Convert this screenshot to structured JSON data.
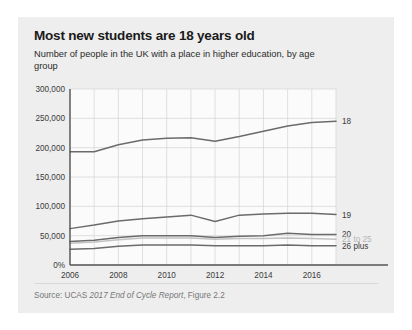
{
  "card": {
    "background": "#eeeeee"
  },
  "header": {
    "title": "Most new students are 18 years old",
    "subtitle": "Number of people in the UK with a place in higher education, by age group"
  },
  "footer": {
    "source_prefix": "Source: UCAS ",
    "source_italic": "2017 End of Cycle Report",
    "source_suffix": ", Figure 2.2"
  },
  "chart_data": {
    "type": "line",
    "title": "Most new students are 18 years old",
    "subtitle": "Number of people in the UK with a place in higher education, by age group",
    "xlabel": "",
    "ylabel": "",
    "x": [
      2006,
      2007,
      2008,
      2009,
      2010,
      2011,
      2012,
      2013,
      2014,
      2015,
      2016,
      2017
    ],
    "xlim": [
      2006,
      2017
    ],
    "ylim": [
      0,
      300000
    ],
    "xticks": [
      2006,
      2008,
      2010,
      2012,
      2014,
      2016
    ],
    "xticklabels": [
      "2006",
      "2008",
      "2010",
      "2012",
      "2014",
      "2016"
    ],
    "yticks": [
      0,
      50000,
      100000,
      150000,
      200000,
      250000,
      300000
    ],
    "yticklabels": [
      "0%",
      "50,000",
      "100,000",
      "150,000",
      "200,000",
      "250,000",
      "300,000"
    ],
    "grid": true,
    "legend_position": "right-inline",
    "series": [
      {
        "name": "18",
        "label": "18",
        "color": "#6b6b6b",
        "label_faint": false,
        "values": [
          193000,
          193000,
          205000,
          213000,
          216000,
          217000,
          211000,
          219000,
          228000,
          237000,
          243000,
          245000
        ]
      },
      {
        "name": "19",
        "label": "19",
        "color": "#6b6b6b",
        "label_faint": false,
        "values": [
          62000,
          68000,
          75000,
          79000,
          82000,
          85000,
          74000,
          85000,
          87000,
          88000,
          88000,
          86000
        ]
      },
      {
        "name": "20",
        "label": "20",
        "color": "#6b6b6b",
        "label_faint": false,
        "values": [
          40000,
          42000,
          47000,
          50000,
          50000,
          50000,
          47000,
          49000,
          50000,
          54000,
          52000,
          52000
        ]
      },
      {
        "name": "21 to 25",
        "label": "21 to 25",
        "color": "#c2c2c2",
        "label_faint": true,
        "values": [
          37000,
          39000,
          43000,
          46000,
          46000,
          46000,
          44000,
          45000,
          45000,
          46000,
          45000,
          44000
        ]
      },
      {
        "name": "26 plus",
        "label": "26 plus",
        "color": "#6b6b6b",
        "label_faint": false,
        "values": [
          27000,
          28000,
          32000,
          34000,
          34000,
          34000,
          33000,
          33000,
          33000,
          34000,
          33000,
          33000
        ]
      }
    ]
  }
}
